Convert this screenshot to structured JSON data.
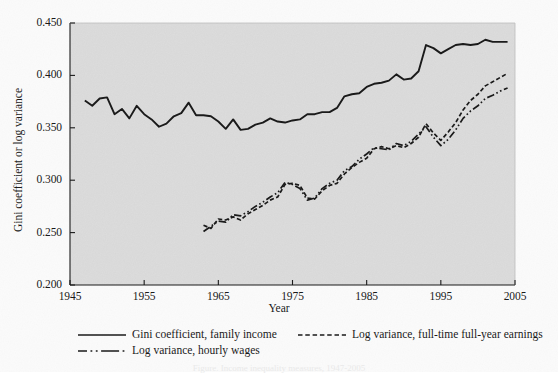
{
  "chart_data": {
    "type": "line",
    "title": "",
    "xlabel": "Year",
    "ylabel": "Gini coefficient or log variance",
    "xlim": [
      1945,
      2005
    ],
    "ylim": [
      0.2,
      0.45
    ],
    "xticks": [
      "1945",
      "1955",
      "1965",
      "1975",
      "1985",
      "1995",
      "2005"
    ],
    "xtick_values": [
      1945,
      1955,
      1965,
      1975,
      1985,
      1995,
      2005
    ],
    "yticks": [
      "0.200",
      "0.250",
      "0.300",
      "0.350",
      "0.400",
      "0.450"
    ],
    "ytick_values": [
      0.2,
      0.25,
      0.3,
      0.35,
      0.4,
      0.45
    ],
    "grid": false,
    "legend_position": "below",
    "plot_background": "#dcdcdc",
    "line_color": "#1a1a1a",
    "series": [
      {
        "name": "Gini coefficient, family income",
        "style": "solid",
        "x": [
          1947,
          1948,
          1949,
          1950,
          1951,
          1952,
          1953,
          1954,
          1955,
          1956,
          1957,
          1958,
          1959,
          1960,
          1961,
          1962,
          1963,
          1964,
          1965,
          1966,
          1967,
          1968,
          1969,
          1970,
          1971,
          1972,
          1973,
          1974,
          1975,
          1976,
          1977,
          1978,
          1979,
          1980,
          1981,
          1982,
          1983,
          1984,
          1985,
          1986,
          1987,
          1988,
          1989,
          1990,
          1991,
          1992,
          1993,
          1994,
          1995,
          1996,
          1997,
          1998,
          1999,
          2000,
          2001,
          2002,
          2003,
          2004
        ],
        "values": [
          0.376,
          0.371,
          0.378,
          0.379,
          0.363,
          0.368,
          0.359,
          0.371,
          0.363,
          0.358,
          0.351,
          0.354,
          0.361,
          0.364,
          0.374,
          0.362,
          0.362,
          0.361,
          0.356,
          0.349,
          0.358,
          0.348,
          0.349,
          0.353,
          0.355,
          0.359,
          0.356,
          0.355,
          0.357,
          0.358,
          0.363,
          0.363,
          0.365,
          0.365,
          0.369,
          0.38,
          0.382,
          0.383,
          0.389,
          0.392,
          0.393,
          0.395,
          0.401,
          0.396,
          0.397,
          0.404,
          0.429,
          0.426,
          0.421,
          0.425,
          0.429,
          0.43,
          0.429,
          0.43,
          0.434,
          0.432,
          0.432,
          0.432
        ]
      },
      {
        "name": "Log variance, full-time full-year earnings",
        "style": "dashed",
        "x": [
          1963,
          1964,
          1965,
          1966,
          1967,
          1968,
          1969,
          1970,
          1971,
          1972,
          1973,
          1974,
          1975,
          1976,
          1977,
          1978,
          1979,
          1980,
          1981,
          1982,
          1983,
          1984,
          1985,
          1986,
          1987,
          1988,
          1989,
          1990,
          1991,
          1992,
          1993,
          1994,
          1995,
          1996,
          1997,
          1998,
          1999,
          2000,
          2001,
          2002,
          2003,
          2004
        ],
        "values": [
          0.257,
          0.254,
          0.263,
          0.262,
          0.265,
          0.262,
          0.268,
          0.272,
          0.276,
          0.281,
          0.284,
          0.296,
          0.297,
          0.295,
          0.283,
          0.282,
          0.29,
          0.295,
          0.297,
          0.306,
          0.312,
          0.317,
          0.321,
          0.33,
          0.332,
          0.33,
          0.333,
          0.331,
          0.335,
          0.341,
          0.354,
          0.345,
          0.338,
          0.346,
          0.355,
          0.367,
          0.376,
          0.382,
          0.39,
          0.394,
          0.398,
          0.402
        ]
      },
      {
        "name": "Log variance, hourly wages",
        "style": "dashdotdot",
        "x": [
          1963,
          1964,
          1965,
          1966,
          1967,
          1968,
          1969,
          1970,
          1971,
          1972,
          1973,
          1974,
          1975,
          1976,
          1977,
          1978,
          1979,
          1980,
          1981,
          1982,
          1983,
          1984,
          1985,
          1986,
          1987,
          1988,
          1989,
          1990,
          1991,
          1992,
          1993,
          1994,
          1995,
          1996,
          1997,
          1998,
          1999,
          2000,
          2001,
          2002,
          2003,
          2004
        ],
        "values": [
          0.251,
          0.256,
          0.261,
          0.26,
          0.267,
          0.266,
          0.27,
          0.275,
          0.279,
          0.284,
          0.288,
          0.298,
          0.296,
          0.292,
          0.281,
          0.283,
          0.292,
          0.297,
          0.3,
          0.309,
          0.313,
          0.32,
          0.325,
          0.331,
          0.33,
          0.329,
          0.335,
          0.333,
          0.337,
          0.344,
          0.351,
          0.341,
          0.333,
          0.339,
          0.348,
          0.359,
          0.366,
          0.371,
          0.378,
          0.381,
          0.385,
          0.388
        ]
      }
    ]
  },
  "legend": {
    "items": [
      {
        "label": "Gini coefficient, family income",
        "style": "solid"
      },
      {
        "label": "Log variance, full-time full-year earnings",
        "style": "dashed"
      },
      {
        "label": "Log variance, hourly wages",
        "style": "dashdotdot"
      }
    ]
  },
  "caption": "Figure. Income inequality measures, 1947-2005"
}
